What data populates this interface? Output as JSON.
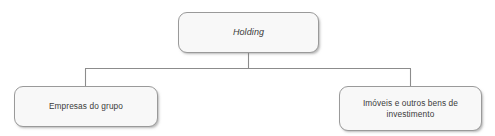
{
  "diagram": {
    "type": "organizational-tree",
    "title": "",
    "background_color": "#ffffff",
    "node_fill_color": "#f8f8f8",
    "node_border_color": "#9a9a9a",
    "connector_color": "#8c8c8c",
    "text_color": "#3b3b3b",
    "nodes": [
      {
        "id": "holding",
        "label": "Holding",
        "role": "root",
        "italic": true
      },
      {
        "id": "empresas",
        "label": "Empresas do grupo",
        "role": "child",
        "italic": false
      },
      {
        "id": "imoveis",
        "label": "Imóveis e outros bens de\ninvestimento",
        "role": "child",
        "italic": false
      }
    ],
    "edges": [
      {
        "from": "holding",
        "to": "empresas"
      },
      {
        "from": "holding",
        "to": "imoveis"
      }
    ]
  }
}
